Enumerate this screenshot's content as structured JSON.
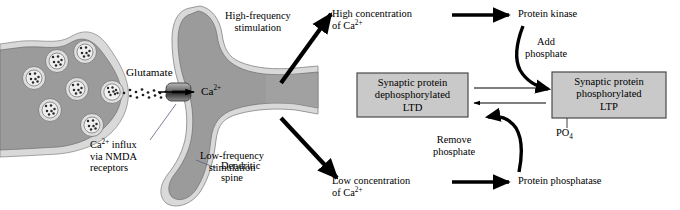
{
  "figure": {
    "domain": "biology-diagram",
    "title_internal": "NMDA receptor calcium signalling: LTP and LTD pathway",
    "colors": {
      "cytoplasm_gray": "#9b9b9b",
      "membrane_light": "#d9d9d9",
      "vesicle_fill": "#e8e8e8",
      "box_fill": "#c9c9c9",
      "box_stroke": "#4a4a4a",
      "arrow_black": "#000000",
      "leader_gray": "#555555",
      "background": "#ffffff"
    }
  },
  "cell": {
    "presynaptic_label": "Glutamate",
    "calcium_label": "Ca",
    "calcium_charge": "2+",
    "vesicle_count": 7,
    "receptor_name": "nmda-receptor-channel"
  },
  "annotations": {
    "ca_influx": {
      "line1_pre": "Ca",
      "line1_sup": "2+",
      "line1_post": " influx",
      "line2": "via NMDA",
      "line3": "receptors"
    },
    "dendritic_spine": {
      "line1": "Dendritic",
      "line2": "spine"
    },
    "high_freq": {
      "line1": "High-frequency",
      "line2": "stimulation"
    },
    "low_freq": {
      "line1": "Low-frequency",
      "line2": "stimulation"
    }
  },
  "pathway": {
    "high_conc": {
      "line1": "High concentration",
      "line2_pre": "of Ca",
      "line2_sup": "2+"
    },
    "low_conc": {
      "line1": "Low concentration",
      "line2_pre": "of Ca",
      "line2_sup": "2+"
    },
    "protein_kinase": "Protein kinase",
    "protein_phosphatase": "Protein phosphatase",
    "add_phosphate": {
      "line1": "Add",
      "line2": "phosphate"
    },
    "remove_phosphate": {
      "line1": "Remove",
      "line2": "phosphate"
    },
    "phosphate_group": {
      "text": "PO",
      "subscript": "4"
    }
  },
  "boxes": {
    "ltd": {
      "line1": "Synaptic protein",
      "line2": "dephosphorylated",
      "line3": "LTD"
    },
    "ltp": {
      "line1": "Synaptic protein",
      "line2": "phosphorylated",
      "line3": "LTP"
    }
  }
}
